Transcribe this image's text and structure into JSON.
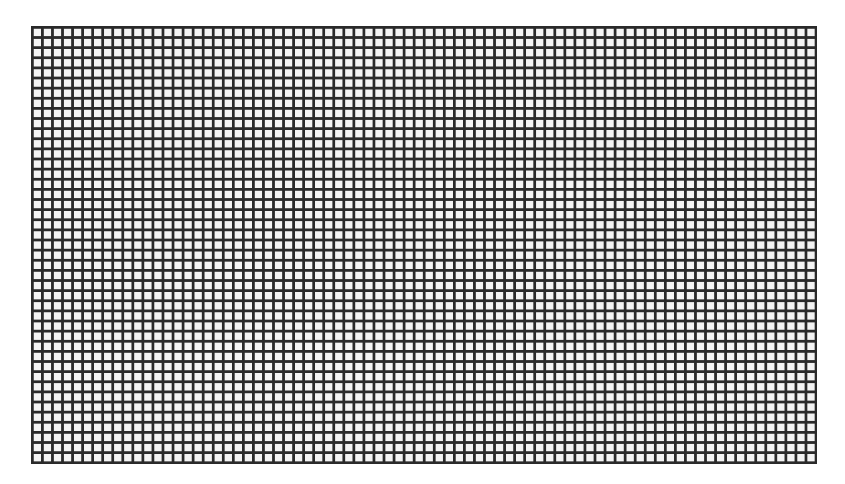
{
  "image": {
    "description": "Uniform square grid / mesh pattern",
    "background_color": "#ffffff"
  },
  "grid": {
    "left": 31,
    "top": 26,
    "width": 784,
    "height": 436,
    "cell_pitch_px": 10,
    "line_thickness_px": 3,
    "line_color": "#2a2a2a",
    "cell_fill_color": "#f4f4f4",
    "approx_columns": 78,
    "approx_rows": 43
  }
}
